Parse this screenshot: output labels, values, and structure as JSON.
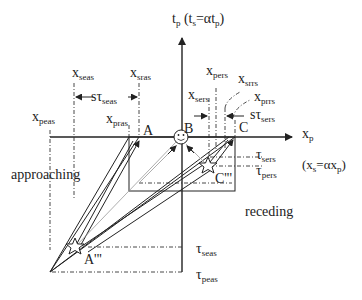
{
  "diagram": {
    "axes": {
      "vertical": {
        "label": "t",
        "sub": "p",
        "paren_pre": "(t",
        "paren_sub": "s",
        "paren_mid": "=αt",
        "paren_sub2": "p",
        "paren_end": ")"
      },
      "horizontal": {
        "label": "x",
        "sub": "p",
        "paren_pre": "(x",
        "paren_sub": "s",
        "paren_mid": "=αx",
        "paren_sub2": "p",
        "paren_end": ")"
      }
    },
    "top_labels": {
      "x_seas": {
        "main": "x",
        "sub": "seas"
      },
      "x_sras": {
        "main": "x",
        "sub": "sras"
      },
      "s_tau_seas": {
        "main": "sτ",
        "sub": "seas"
      },
      "x_peas": {
        "main": "x",
        "sub": "peas"
      },
      "x_pras": {
        "main": "x",
        "sub": "pras"
      },
      "x_pers": {
        "main": "x",
        "sub": "pers"
      },
      "x_srrs": {
        "main": "x",
        "sub": "srrs"
      },
      "x_sers": {
        "main": "x",
        "sub": "sers"
      },
      "x_prrs": {
        "main": "x",
        "sub": "prrs"
      },
      "s_tau_sers": {
        "main": "sτ",
        "sub": "sers"
      }
    },
    "points": {
      "A": "A",
      "B": "B",
      "C": "C",
      "A3": "A'''",
      "C3": "C'''"
    },
    "tau_labels": {
      "tau_sers": {
        "main": "τ",
        "sub": "sers"
      },
      "tau_pers": {
        "main": "τ",
        "sub": "pers"
      },
      "tau_seas": {
        "main": "τ",
        "sub": "seas"
      },
      "tau_peas": {
        "main": "τ",
        "sub": "peas"
      }
    },
    "regions": {
      "approaching": "approaching",
      "receding": "receding"
    },
    "observer_icon": "smiley-face",
    "source_icons": [
      "star",
      "star"
    ]
  }
}
